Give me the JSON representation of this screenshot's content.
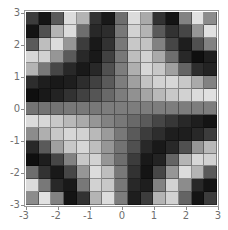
{
  "chart_data": {
    "type": "heatmap",
    "title": "",
    "xlabel": "",
    "ylabel": "",
    "xlim": [
      -3,
      3
    ],
    "ylim": [
      -3,
      3
    ],
    "x_ticks": [
      "-3",
      "-2",
      "-1",
      "0",
      "1",
      "2",
      "3"
    ],
    "y_ticks": [
      "3",
      "2",
      "1",
      "0",
      "-1",
      "-2",
      "-3"
    ],
    "colormap": "grayscale",
    "grid": "15x15",
    "rows_top_to_bottom_gray_0_255": [
      [
        60,
        20,
        90,
        220,
        180,
        50,
        25,
        110,
        220,
        170,
        50,
        20,
        130,
        225,
        140
      ],
      [
        20,
        80,
        180,
        220,
        110,
        40,
        45,
        120,
        210,
        180,
        90,
        50,
        70,
        150,
        225
      ],
      [
        90,
        190,
        220,
        150,
        60,
        25,
        50,
        120,
        200,
        195,
        130,
        70,
        30,
        80,
        130
      ],
      [
        215,
        210,
        150,
        90,
        40,
        25,
        65,
        120,
        190,
        210,
        170,
        110,
        40,
        15,
        30
      ],
      [
        180,
        120,
        70,
        40,
        25,
        40,
        80,
        125,
        175,
        215,
        200,
        160,
        100,
        45,
        35
      ],
      [
        45,
        30,
        25,
        30,
        45,
        65,
        90,
        125,
        160,
        195,
        210,
        215,
        200,
        170,
        130
      ],
      [
        15,
        25,
        35,
        50,
        65,
        85,
        105,
        125,
        145,
        165,
        185,
        200,
        210,
        220,
        225
      ],
      [
        115,
        115,
        115,
        120,
        120,
        120,
        125,
        125,
        125,
        125,
        125,
        125,
        125,
        125,
        125
      ],
      [
        220,
        215,
        200,
        185,
        170,
        150,
        130,
        120,
        105,
        90,
        70,
        55,
        40,
        30,
        20
      ],
      [
        140,
        175,
        200,
        215,
        210,
        185,
        155,
        120,
        90,
        60,
        45,
        30,
        30,
        40,
        60
      ],
      [
        40,
        90,
        160,
        200,
        215,
        190,
        150,
        115,
        80,
        40,
        25,
        40,
        80,
        150,
        185
      ],
      [
        15,
        30,
        70,
        130,
        200,
        210,
        150,
        110,
        60,
        25,
        35,
        100,
        180,
        215,
        210
      ],
      [
        110,
        50,
        25,
        70,
        150,
        220,
        190,
        120,
        50,
        20,
        70,
        150,
        220,
        180,
        90
      ],
      [
        220,
        120,
        40,
        25,
        120,
        210,
        200,
        120,
        40,
        30,
        130,
        210,
        140,
        40,
        20
      ],
      [
        140,
        225,
        130,
        20,
        50,
        180,
        220,
        125,
        30,
        60,
        180,
        210,
        100,
        20,
        60
      ]
    ]
  },
  "axes": {
    "x_ticks": [
      {
        "label": "-3",
        "x": 26
      },
      {
        "label": "-2",
        "x": 58
      },
      {
        "label": "-1",
        "x": 90
      },
      {
        "label": "0",
        "x": 122
      },
      {
        "label": "1",
        "x": 154
      },
      {
        "label": "2",
        "x": 186
      },
      {
        "label": "3",
        "x": 218
      }
    ],
    "y_ticks": [
      {
        "label": "3",
        "y": 13
      },
      {
        "label": "2",
        "y": 45
      },
      {
        "label": "1",
        "y": 77
      },
      {
        "label": "0",
        "y": 109
      },
      {
        "label": "-1",
        "y": 141
      },
      {
        "label": "-2",
        "y": 173
      },
      {
        "label": "-3",
        "y": 205
      }
    ]
  }
}
